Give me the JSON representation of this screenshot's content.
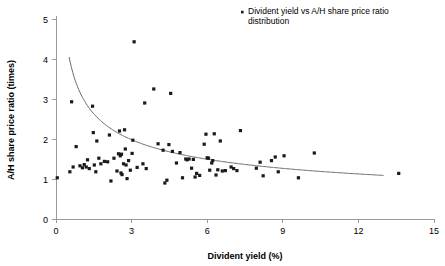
{
  "chart_data": {
    "type": "scatter",
    "title": "",
    "xlabel": "Divident yield (%)",
    "ylabel": "A/H share price ratio (times)",
    "xlim": [
      0,
      15
    ],
    "ylim": [
      0,
      5
    ],
    "xticks": [
      "0",
      "3",
      "6",
      "9",
      "12",
      "15"
    ],
    "xtick_values": [
      0,
      3,
      6,
      9,
      12,
      15
    ],
    "yticks": [
      "0",
      "1",
      "2",
      "3",
      "4",
      "5"
    ],
    "ytick_values": [
      0,
      1,
      2,
      3,
      4,
      5
    ],
    "grid": false,
    "legend_position": "top-right",
    "legend": [
      {
        "label": "Divident yield vs A/H share price ratio distribution",
        "label_line1": "Divident yield vs A/H share price ratio",
        "label_line2": "distribution",
        "marker": "square",
        "color": "#1a1a1a"
      }
    ],
    "series": [
      {
        "name": "Divident yield vs A/H share price ratio distribution",
        "color": "#1a1a1a",
        "marker": "square",
        "points": [
          [
            0.05,
            1.03
          ],
          [
            0.55,
            1.18
          ],
          [
            0.62,
            2.93
          ],
          [
            0.68,
            1.3
          ],
          [
            0.8,
            1.81
          ],
          [
            0.95,
            1.33
          ],
          [
            1.05,
            1.28
          ],
          [
            1.12,
            1.36
          ],
          [
            1.2,
            1.3
          ],
          [
            1.25,
            1.48
          ],
          [
            1.32,
            1.26
          ],
          [
            1.45,
            2.82
          ],
          [
            1.48,
            2.16
          ],
          [
            1.52,
            1.35
          ],
          [
            1.58,
            1.18
          ],
          [
            1.62,
            1.95
          ],
          [
            1.7,
            1.52
          ],
          [
            1.78,
            1.38
          ],
          [
            1.92,
            1.44
          ],
          [
            2.05,
            1.43
          ],
          [
            2.12,
            2.1
          ],
          [
            2.18,
            0.95
          ],
          [
            2.3,
            1.52
          ],
          [
            2.42,
            1.2
          ],
          [
            2.48,
            1.63
          ],
          [
            2.52,
            2.2
          ],
          [
            2.55,
            1.58
          ],
          [
            2.58,
            1.15
          ],
          [
            2.6,
            1.62
          ],
          [
            2.62,
            1.11
          ],
          [
            2.68,
            1.38
          ],
          [
            2.72,
            2.23
          ],
          [
            2.75,
            1.75
          ],
          [
            2.78,
            1.35
          ],
          [
            2.82,
            1.01
          ],
          [
            2.88,
            1.46
          ],
          [
            2.95,
            1.22
          ],
          [
            3.02,
            1.64
          ],
          [
            3.05,
            1.97
          ],
          [
            3.1,
            4.43
          ],
          [
            3.22,
            1.29
          ],
          [
            3.45,
            1.38
          ],
          [
            3.52,
            2.9
          ],
          [
            3.58,
            1.26
          ],
          [
            3.88,
            3.25
          ],
          [
            4.05,
            1.88
          ],
          [
            4.25,
            1.72
          ],
          [
            4.32,
            0.9
          ],
          [
            4.4,
            0.97
          ],
          [
            4.48,
            1.86
          ],
          [
            4.55,
            3.14
          ],
          [
            4.62,
            1.69
          ],
          [
            4.78,
            1.4
          ],
          [
            4.92,
            1.66
          ],
          [
            5.02,
            1.03
          ],
          [
            5.15,
            1.5
          ],
          [
            5.2,
            1.48
          ],
          [
            5.28,
            1.5
          ],
          [
            5.38,
            1.27
          ],
          [
            5.45,
            1.49
          ],
          [
            5.52,
            1.05
          ],
          [
            5.58,
            1.14
          ],
          [
            5.7,
            1.09
          ],
          [
            5.88,
            1.87
          ],
          [
            5.95,
            2.12
          ],
          [
            6.0,
            1.53
          ],
          [
            6.05,
            1.52
          ],
          [
            6.1,
            1.22
          ],
          [
            6.18,
            1.4
          ],
          [
            6.22,
            1.46
          ],
          [
            6.28,
            2.13
          ],
          [
            6.35,
            1.1
          ],
          [
            6.42,
            1.23
          ],
          [
            6.52,
            1.95
          ],
          [
            6.6,
            1.2
          ],
          [
            6.72,
            1.21
          ],
          [
            6.95,
            1.3
          ],
          [
            7.05,
            1.26
          ],
          [
            7.18,
            1.21
          ],
          [
            7.32,
            2.21
          ],
          [
            7.95,
            1.27
          ],
          [
            8.1,
            1.42
          ],
          [
            8.22,
            1.08
          ],
          [
            8.55,
            1.46
          ],
          [
            8.7,
            1.55
          ],
          [
            8.82,
            1.18
          ],
          [
            9.05,
            1.58
          ],
          [
            9.62,
            1.03
          ],
          [
            10.25,
            1.65
          ],
          [
            13.6,
            1.14
          ]
        ]
      }
    ],
    "trend": {
      "type": "power",
      "color": "#6b6b6b",
      "description": "decaying power-law fit through the point cloud",
      "x_start": 0.52,
      "x_end": 13.0,
      "y_start": 4.05,
      "y_end": 1.09
    }
  }
}
